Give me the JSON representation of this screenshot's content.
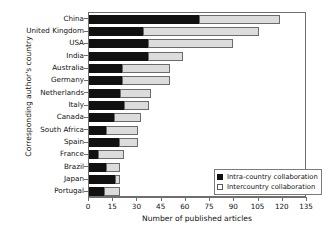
{
  "chart_data": {
    "type": "bar",
    "orientation": "horizontal",
    "stacked": true,
    "title": "",
    "xlabel": "Number of published articles",
    "ylabel": "Corresponding author's country",
    "xlim": [
      0,
      135
    ],
    "xticks": [
      0,
      15,
      30,
      45,
      60,
      75,
      90,
      105,
      120,
      135
    ],
    "grid": false,
    "legend_position": "bottom-right",
    "categories": [
      "China",
      "United Kingdom",
      "USA",
      "India",
      "Australia",
      "Germany",
      "Netherlands",
      "Italy",
      "Canada",
      "South Africa",
      "Spain",
      "France",
      "Brazil",
      "Japan",
      "Portugal"
    ],
    "series": [
      {
        "name": "Intra-country collaboration",
        "color": "#111111",
        "values": [
          69,
          34,
          37,
          37,
          21,
          21,
          20,
          22,
          16,
          11,
          19,
          6,
          11,
          17,
          10
        ]
      },
      {
        "name": "Intercountry collaboration",
        "color": "#dcdcdc",
        "values": [
          50,
          72,
          53,
          22,
          30,
          30,
          19,
          16,
          17,
          20,
          12,
          16,
          9,
          3,
          10
        ]
      }
    ],
    "totals": [
      119,
      106,
      90,
      59,
      51,
      51,
      39,
      38,
      33,
      31,
      31,
      22,
      20,
      20,
      20
    ]
  },
  "legend": {
    "items": [
      {
        "label": "Intra-country collaboration",
        "key": "filled-square"
      },
      {
        "label": "Intercountry collaboration",
        "key": "open-square"
      }
    ]
  },
  "colors": {
    "intra": "#111111",
    "inter": "#dcdcdc",
    "inter_border": "#6b6b6b",
    "axis": "#6e6e6e",
    "text": "#111111",
    "background": "#ffffff"
  }
}
